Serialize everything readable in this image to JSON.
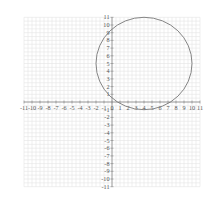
{
  "chart_data": {
    "type": "scatter",
    "title": "",
    "xlabel": "",
    "ylabel": "",
    "xlim": [
      -11,
      11
    ],
    "ylim": [
      -11,
      11
    ],
    "grid": true,
    "x_ticks": [
      -11,
      -10,
      -9,
      -8,
      -7,
      -6,
      -5,
      -4,
      -3,
      -2,
      -1,
      0,
      1,
      2,
      3,
      4,
      5,
      6,
      7,
      8,
      9,
      10,
      11
    ],
    "y_ticks": [
      -11,
      -10,
      -9,
      -8,
      -7,
      -6,
      -5,
      -4,
      -3,
      -2,
      -1,
      0,
      1,
      2,
      3,
      4,
      5,
      6,
      7,
      8,
      9,
      10,
      11
    ],
    "shapes": [
      {
        "kind": "circle",
        "center": [
          4,
          5
        ],
        "radius": 6,
        "color": "#777777"
      }
    ]
  },
  "layout": {
    "origin_px": [
      112,
      102
    ],
    "unit_x_px": 8.0,
    "unit_y_px": 7.7
  }
}
